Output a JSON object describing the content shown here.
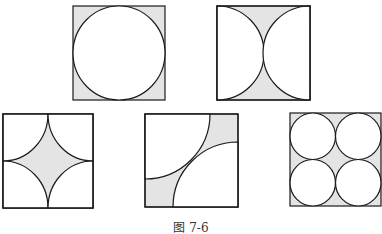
{
  "figure": {
    "caption": "图 7-6",
    "colors": {
      "stroke": "#1a1a1a",
      "shaded": "#e4e4e4",
      "background": "#ffffff"
    },
    "panels": [
      {
        "id": "a",
        "description": "square with inscribed circle, corners shaded"
      },
      {
        "id": "b",
        "description": "square with two semicircles on left and right sides, region between shaded"
      },
      {
        "id": "c",
        "description": "square with four quarter-circles at corners, central concave star shaded"
      },
      {
        "id": "d",
        "description": "square with two quarter-circles from opposite corners, off-diagonal corners shaded"
      },
      {
        "id": "e",
        "description": "square with four inscribed circles in 2x2 grid, gaps shaded"
      }
    ]
  }
}
